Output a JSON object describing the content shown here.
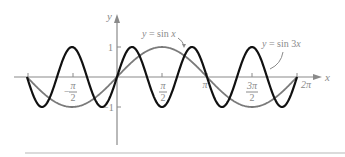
{
  "chart_data": {
    "type": "line",
    "title": "",
    "xlabel": "x",
    "ylabel": "y",
    "xlim": [
      -3.14159,
      6.28319
    ],
    "ylim": [
      -1,
      1
    ],
    "grid": false,
    "legend": "inline annotations",
    "x_ticks": [
      {
        "value": -3.14159,
        "label": ""
      },
      {
        "value": -1.5708,
        "label_num": "π",
        "label_den": "2",
        "sign": "−"
      },
      {
        "value": 1.5708,
        "label_num": "π",
        "label_den": "2",
        "sign": ""
      },
      {
        "value": 3.14159,
        "label": "π"
      },
      {
        "value": 4.71239,
        "label_num": "3π",
        "label_den": "2",
        "sign": ""
      },
      {
        "value": 6.28319,
        "label": "2π"
      }
    ],
    "y_ticks": [
      {
        "value": 1,
        "label": "1"
      },
      {
        "value": -1,
        "label": "−1"
      }
    ],
    "series": [
      {
        "name": "y = sin x",
        "function": "sin(x)",
        "color": "#7a7a7a",
        "domain": [
          -3.14159,
          6.28319
        ]
      },
      {
        "name": "y = sin 3x",
        "function": "sin(3x)",
        "color": "#111111",
        "domain": [
          -3.14159,
          6.28319
        ]
      }
    ],
    "annotations": [
      {
        "text_prefix": "y = sin ",
        "text_var": "x",
        "points_to": "y = sin x"
      },
      {
        "text_prefix": "y = sin 3",
        "text_var": "x",
        "points_to": "y = sin 3x"
      }
    ]
  },
  "layout": {
    "origin_px": [
      117,
      77
    ],
    "px_per_x_unit": 28.65,
    "px_per_y_unit": 30
  },
  "labels": {
    "x_axis": "x",
    "y_axis": "y",
    "one": "1",
    "neg_one": "−1",
    "pi": "π",
    "two_pi": "2π",
    "neg_pi_half_sign": "−",
    "pi_num": "π",
    "three_pi_num": "3π",
    "den": "2",
    "sinx_prefix": "y = sin ",
    "sinx_var": "x",
    "sin3x_prefix": "y = sin 3",
    "sin3x_var": "x"
  }
}
